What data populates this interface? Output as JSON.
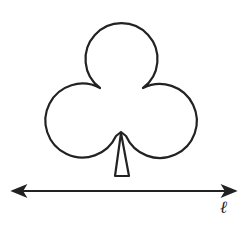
{
  "figure": {
    "type": "club symbol above a line",
    "line_label": "ℓ",
    "stroke_color": "#222222",
    "background": "#ffffff"
  }
}
